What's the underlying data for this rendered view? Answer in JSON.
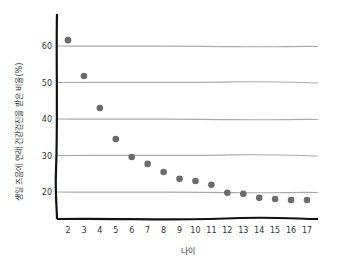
{
  "chart_data": {
    "type": "scatter",
    "title": "",
    "xlabel": "나이",
    "ylabel": "생일 즈음에 연례 건강검진을 받은 비율(%)",
    "x": [
      2,
      3,
      4,
      5,
      6,
      7,
      8,
      9,
      10,
      11,
      12,
      13,
      14,
      15,
      16,
      17
    ],
    "series": [
      {
        "name": "비율",
        "values": [
          61.6,
          51.8,
          43.0,
          34.5,
          29.6,
          27.7,
          25.5,
          23.6,
          23.0,
          22.0,
          19.8,
          19.5,
          18.4,
          18.1,
          17.8,
          17.8
        ],
        "color": "#6b6b6b"
      }
    ],
    "x_ticks": [
      "2",
      "3",
      "4",
      "5",
      "6",
      "7",
      "8",
      "9",
      "10",
      "11",
      "12",
      "13",
      "14",
      "15",
      "16",
      "17"
    ],
    "y_ticks": [
      "20",
      "30",
      "40",
      "50",
      "60"
    ],
    "ylim": [
      12.5,
      66
    ],
    "grid": true,
    "legend": "none"
  },
  "colors": {
    "points": "#6b6b6b",
    "grid": "#aaaaaa",
    "axis": "#111111"
  }
}
